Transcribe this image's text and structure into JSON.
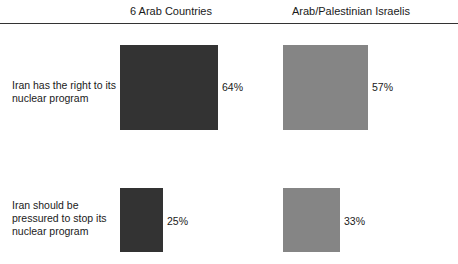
{
  "colors": {
    "series_6_arab_countries": "#333333",
    "series_arab_palestinian_israelis": "#858585",
    "rule": "#333333",
    "text": "#1a1a1a",
    "background": "#ffffff"
  },
  "chart_data": {
    "type": "bar",
    "title": "",
    "subtitle": "",
    "xlabel": "",
    "ylabel": "",
    "grid": false,
    "legend_position": "top",
    "orientation": "vertical",
    "value_suffix": "%",
    "ylim": [
      0,
      100
    ],
    "categories": [
      "Iran has the right to its nuclear program",
      "Iran should be pressured to stop its nuclear program"
    ],
    "series": [
      {
        "name": "6 Arab Countries",
        "values": [
          64,
          57
        ]
      },
      {
        "name": "Arab/Palestinian Israelis",
        "values": [
          25,
          33
        ]
      }
    ],
    "cells": [
      [
        {
          "value": 64,
          "label": "64%",
          "series": "6 Arab Countries"
        },
        {
          "value": 57,
          "label": "57%",
          "series": "Arab/Palestinian Israelis"
        }
      ],
      [
        {
          "value": 25,
          "label": "25%",
          "series": "6 Arab Countries"
        },
        {
          "value": 33,
          "label": "33%",
          "series": "Arab/Palestinian Israelis"
        }
      ]
    ]
  },
  "headers": [
    {
      "label": "6 Arab Countries"
    },
    {
      "label": "Arab/Palestinian Israelis"
    }
  ],
  "rows": [
    {
      "label": "Iran has the right to its nuclear program"
    },
    {
      "label": "Iran should be pressured to stop its nuclear program"
    }
  ],
  "values": {
    "r0c0": "64%",
    "r0c1": "57%",
    "r1c0": "25%",
    "r1c1": "33%"
  }
}
